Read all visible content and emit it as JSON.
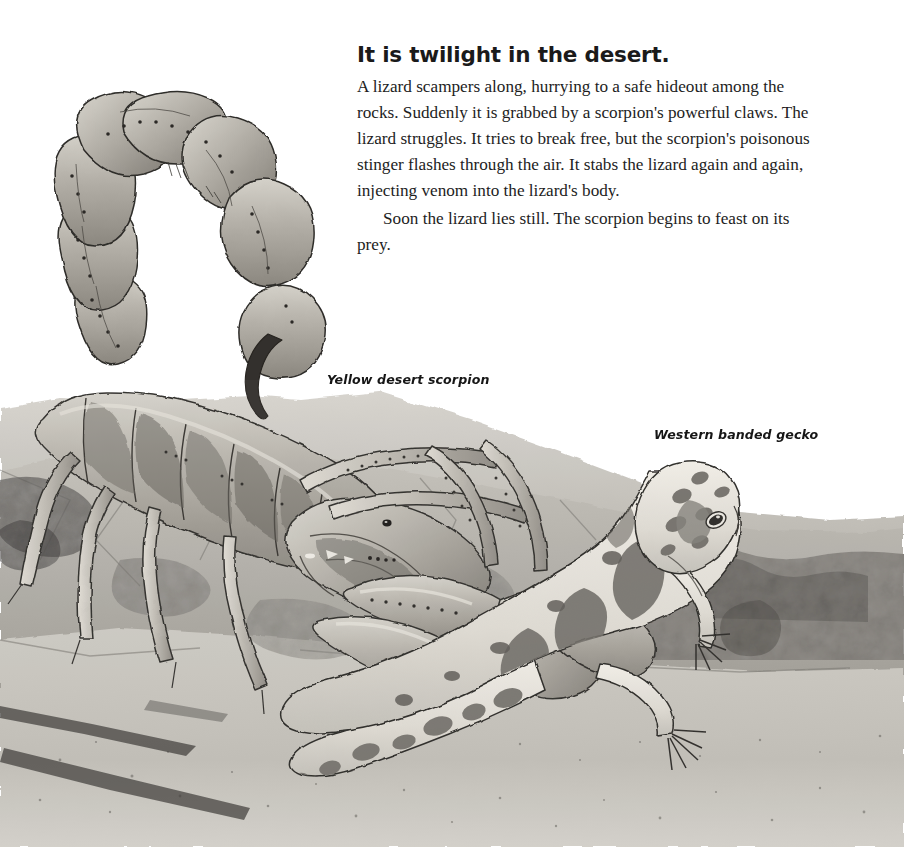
{
  "page": {
    "width": 904,
    "height": 847,
    "background_color": "#ffffff",
    "kind": "illustrated-book-page"
  },
  "text": {
    "headline": "It is twilight in the desert.",
    "paragraphs": [
      "A lizard scampers along, hurrying to a safe hideout among the rocks. Suddenly it is grabbed by a scorpion's powerful claws. The lizard struggles. It tries to break free, but the scorpion's poisonous stinger flashes through the air. It stabs the lizard again and again, injecting venom into the lizard's body.",
      "Soon the lizard lies still. The scorpion begins to feast on its prey."
    ]
  },
  "captions": {
    "scorpion": "Yellow desert scorpion",
    "gecko": "Western banded gecko"
  },
  "illustration": {
    "medium": "grayscale watercolor and ink",
    "subjects": [
      "yellow desert scorpion",
      "western banded gecko",
      "desert rocks"
    ],
    "palette": {
      "paper": "#ffffff",
      "rock_light": "#cfccc6",
      "rock_mid": "#b0ada6",
      "rock_dark": "#8d8a84",
      "rock_shadow": "#585650",
      "body_light": "#c8c5bd",
      "body_mid": "#a5a199",
      "body_dark": "#7e7a73",
      "ink": "#2b2a27",
      "gecko_pale": "#e8e5dd",
      "gecko_spot": "#6f6c66"
    }
  }
}
